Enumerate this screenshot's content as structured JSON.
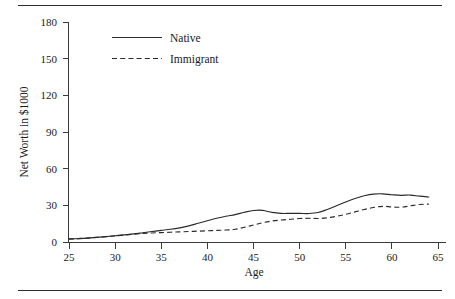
{
  "figure": {
    "has_top_rule": true,
    "has_bottom_rule": true,
    "background_color": "#ffffff",
    "line_color": "#2a2a2a"
  },
  "chart_data": {
    "type": "line",
    "title": "",
    "subtitle": "",
    "xlabel": "Age",
    "ylabel": "Net Worth in $1000",
    "xlim": [
      25,
      65
    ],
    "ylim": [
      0,
      180
    ],
    "xticks": [
      25,
      30,
      35,
      40,
      45,
      50,
      55,
      60,
      65
    ],
    "yticks": [
      0,
      30,
      60,
      90,
      120,
      150,
      180
    ],
    "xtick_labels": [
      "25",
      "30",
      "35",
      "40",
      "45",
      "50",
      "55",
      "60",
      "65"
    ],
    "ytick_labels": [
      "0",
      "30",
      "60",
      "90",
      "120",
      "150",
      "180"
    ],
    "grid": false,
    "legend_position": "upper-left-inside",
    "x": [
      25,
      26,
      27,
      28,
      29,
      30,
      31,
      32,
      33,
      34,
      35,
      36,
      37,
      38,
      39,
      40,
      41,
      42,
      43,
      44,
      45,
      46,
      47,
      48,
      49,
      50,
      51,
      52,
      53,
      54,
      55,
      56,
      57,
      58,
      59,
      60,
      61,
      62,
      63,
      64
    ],
    "series": [
      {
        "name": "Native",
        "style": "solid",
        "values": [
          2.5,
          2.8,
          3.2,
          3.8,
          4.4,
          5.1,
          5.8,
          6.6,
          7.6,
          8.6,
          9.5,
          10.4,
          11.6,
          13.2,
          15.3,
          17.4,
          19.4,
          21.1,
          22.4,
          24.3,
          25.8,
          25.9,
          24.2,
          23.4,
          23.4,
          23.4,
          23.3,
          24.1,
          26.6,
          29.6,
          32.8,
          35.6,
          37.8,
          39.2,
          39.4,
          38.7,
          38.2,
          38.4,
          37.5,
          36.8
        ]
      },
      {
        "name": "Immigrant",
        "style": "dashed",
        "values": [
          2.4,
          2.8,
          3.2,
          3.8,
          4.4,
          5.0,
          5.7,
          6.4,
          7.0,
          7.4,
          7.7,
          8.0,
          8.3,
          8.6,
          8.9,
          9.2,
          9.5,
          9.8,
          10.4,
          12.0,
          13.9,
          15.8,
          17.2,
          18.0,
          18.6,
          19.2,
          19.4,
          19.2,
          19.8,
          21.0,
          22.6,
          24.6,
          26.6,
          28.2,
          29.2,
          28.7,
          28.5,
          29.6,
          30.7,
          31.0
        ]
      }
    ],
    "legend": [
      {
        "label": "Native",
        "style": "solid"
      },
      {
        "label": "Immigrant",
        "style": "dashed"
      }
    ]
  }
}
